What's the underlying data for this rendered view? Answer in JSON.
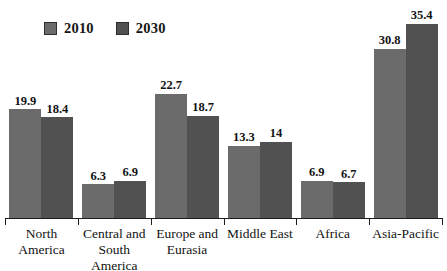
{
  "chart_data": {
    "type": "bar",
    "title": "",
    "subtitle": "",
    "xlabel": "",
    "ylabel": "",
    "grid": false,
    "legend_position": "top-left",
    "ylim": [
      0,
      39.6
    ],
    "categories": [
      "North America",
      "Central and South America",
      "Europe and Eurasia",
      "Middle East",
      "Africa",
      "Asia-Pacific"
    ],
    "series": [
      {
        "name": "2010",
        "color": "#6b6b6b",
        "values": [
          19.9,
          6.3,
          22.7,
          13.3,
          6.9,
          30.8
        ],
        "labels": [
          "19.9",
          "6.3",
          "22.7",
          "13.3",
          "6.9",
          "30.8"
        ]
      },
      {
        "name": "2030",
        "color": "#515151",
        "values": [
          18.4,
          6.9,
          18.7,
          14,
          6.7,
          35.4
        ],
        "labels": [
          "18.4",
          "6.9",
          "18.7",
          "14",
          "6.7",
          "35.4"
        ]
      }
    ]
  },
  "legend": {
    "items": [
      {
        "label": "2010",
        "color": "#6b6b6b"
      },
      {
        "label": "2030",
        "color": "#515151"
      }
    ]
  },
  "axis": {
    "baseline_color": "#1d1d1d"
  },
  "category_labels": [
    "North\nAmerica",
    "Central and\nSouth\nAmerica",
    "Europe and\nEurasia",
    "Middle East",
    "Africa",
    "Asia-Pacific"
  ]
}
